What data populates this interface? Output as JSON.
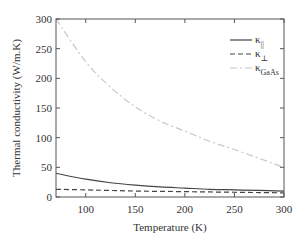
{
  "chart_data": {
    "type": "line",
    "title": "",
    "xlabel": "Temperature (K)",
    "ylabel": "Thermal conductivity (W/m.K)",
    "xlim": [
      70,
      300
    ],
    "ylim": [
      0,
      300
    ],
    "xticks": [
      100,
      150,
      200,
      250,
      300
    ],
    "yticks": [
      0,
      50,
      100,
      150,
      200,
      250,
      300
    ],
    "grid": false,
    "legend_position": "upper right",
    "x": [
      70,
      100,
      125,
      150,
      175,
      200,
      225,
      250,
      275,
      300
    ],
    "series": [
      {
        "name": "κ∥",
        "legend_main": "κ",
        "legend_sub": "||",
        "style": "solid",
        "color": "#444444",
        "values": [
          40,
          30,
          24,
          20,
          17,
          15,
          13,
          12,
          11,
          10
        ]
      },
      {
        "name": "κ⊥",
        "legend_main": "κ",
        "legend_sub": "⊥",
        "style": "dashed",
        "color": "#444444",
        "values": [
          13,
          12,
          11,
          10,
          9.5,
          9,
          8.5,
          8,
          7.5,
          7
        ]
      },
      {
        "name": "κGaAs",
        "legend_main": "κ",
        "legend_sub": "GaAs",
        "style": "dashdot",
        "color": "#c8c8c8",
        "values": [
          300,
          228,
          185,
          152,
          128,
          111,
          94,
          80,
          65,
          50
        ]
      }
    ]
  }
}
